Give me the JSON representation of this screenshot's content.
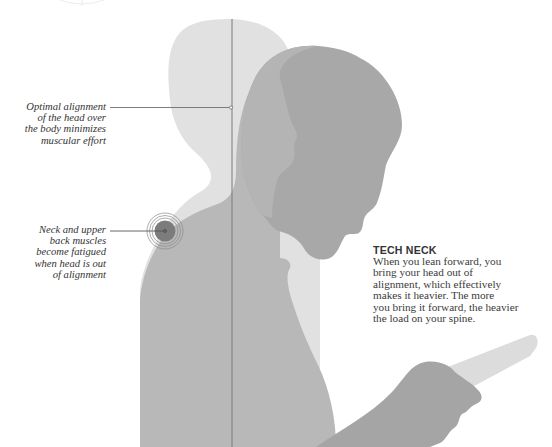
{
  "figure": {
    "title": "TECH NECK",
    "description": "When you lean forward, you\nbring your head out of\nalignment, which effectively\nmakes it heavier. The more\nyou bring it forward, the heavier\nthe load on your spine.",
    "callouts": [
      {
        "id": "alignment",
        "text": "Optimal alignment\nof the head over\nthe body minimizes\nmuscular effort"
      },
      {
        "id": "muscles",
        "text": "Neck and upper\nback muscles\nbecome fatigued\nwhen head is out\nof alignment"
      }
    ],
    "icons": {
      "upright_figure": "upright-silhouette",
      "leaning_figure": "leaning-silhouette",
      "phone": "phone-shape",
      "hand": "hand-shape",
      "target": "target-rings"
    },
    "colors": {
      "upright_figure": "#e1e1e1",
      "leaning_body": "#b8b8b8",
      "leaning_head": "#a8a8a8",
      "hand": "#a5a5a5",
      "phone": "#dcdcdc",
      "alignment_line": "#7a7a7a",
      "target_fill": "#7c7c7c",
      "target_rings": "#8a8a8a",
      "text": "#333333"
    }
  }
}
